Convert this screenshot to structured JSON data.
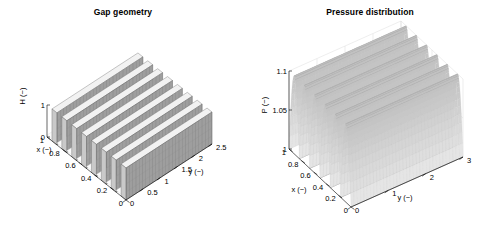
{
  "figure": {
    "background": "#ffffff",
    "panels": 2
  },
  "chart_data": [
    {
      "type": "surface",
      "panel": "left",
      "title": "Gap geometry",
      "xlabel": "x (−)",
      "ylabel": "y (−)",
      "zlabel": "H (−)",
      "xticks": [
        "0",
        "0.2",
        "0.4",
        "0.6",
        "0.8",
        "1"
      ],
      "xtick_values": [
        0,
        0.2,
        0.4,
        0.6,
        0.8,
        1
      ],
      "yticks": [
        "0",
        "0.5",
        "1",
        "1.5",
        "2",
        "2.5"
      ],
      "ytick_values": [
        0,
        0.5,
        1,
        1.5,
        2,
        2.5
      ],
      "zticks": [
        "0",
        "1"
      ],
      "ztick_values": [
        0,
        1
      ],
      "xlim": [
        0,
        1
      ],
      "ylim": [
        0,
        2.5
      ],
      "zlim": [
        0,
        1
      ],
      "grid": false,
      "legend": false,
      "surface_shape": "square-wave ridges along y",
      "ridge_count": 8,
      "ridge_period_x": 0.125,
      "z_high": 1,
      "z_low": 0,
      "face_color": "#9e9e9e",
      "edge_color": "#595959",
      "top_color": "#f2f2f2",
      "description": "Rectangular step gap profile: H alternates between 0 and 1 as a square wave in x, constant in y"
    },
    {
      "type": "surface",
      "panel": "right",
      "title": "Pressure distribution",
      "xlabel": "x (−)",
      "ylabel": "y (−)",
      "zlabel": "P (−)",
      "xticks": [
        "0",
        "0.2",
        "0.4",
        "0.6",
        "0.8",
        "1"
      ],
      "xtick_values": [
        0,
        0.2,
        0.4,
        0.6,
        0.8,
        1
      ],
      "yticks": [
        "0",
        "1",
        "2",
        "3"
      ],
      "ytick_values": [
        0,
        1,
        2,
        3
      ],
      "zticks": [
        "1",
        "1.05",
        "1.1"
      ],
      "ztick_values": [
        1,
        1.05,
        1.1
      ],
      "xlim": [
        0,
        1
      ],
      "ylim": [
        0,
        3
      ],
      "zlim": [
        1,
        1.1
      ],
      "grid": true,
      "legend": false,
      "surface_shape": "smooth sawtooth/wavy ridges along y",
      "ridge_count": 6,
      "p_min": 1.0,
      "p_max": 1.1,
      "face_color": "#e8e8e8",
      "edge_color": "#b5b5b5",
      "crest_color": "#a8a8a8",
      "description": "Pressure P rises from 1 at the boundaries in periodic humps up to about 1.1, periodic in x and uniform in y"
    }
  ]
}
